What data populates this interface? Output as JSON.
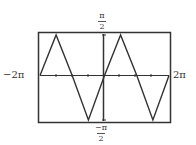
{
  "chart_data": {
    "type": "line",
    "title": "",
    "xlabel": "",
    "ylabel": "",
    "xlim": [
      "-2π",
      "2π"
    ],
    "ylim": [
      "-π/2",
      "π/2"
    ],
    "grid": false,
    "legend": null,
    "x_tick_labels": {
      "left": "−2π",
      "right": "2π"
    },
    "y_tick_labels": {
      "top_num": "π",
      "top_den": "2",
      "bottom_num": "−π",
      "bottom_den": "2"
    },
    "series": [
      {
        "name": "triangle wave",
        "x": [
          -6.2832,
          -4.7124,
          -3.1416,
          -1.5708,
          0,
          1.5708,
          3.1416,
          4.7124,
          6.2832
        ],
        "y": [
          0,
          1.5708,
          0,
          -1.5708,
          0,
          1.5708,
          0,
          -1.5708,
          0
        ]
      }
    ],
    "colors": {
      "curve": "#333333",
      "frame": "#333333",
      "axes": "#333333"
    }
  }
}
